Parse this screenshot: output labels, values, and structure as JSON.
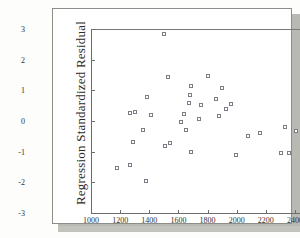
{
  "figure": {
    "ylabel": "Regression Standardized Residual"
  },
  "chart_data": {
    "type": "scatter",
    "title": "",
    "xlabel": "",
    "ylabel": "Regression Standardized Residual",
    "xlim": [
      1000,
      2600
    ],
    "ylim": [
      -3,
      3
    ],
    "xticks": [
      1000,
      1200,
      1400,
      1600,
      1800,
      2000,
      2200,
      2400,
      2600
    ],
    "yticks": [
      3,
      2,
      1,
      0,
      -1,
      -2,
      -3
    ],
    "grid": false,
    "legend": null,
    "marker": "open-square",
    "points": [
      {
        "x": 1500,
        "y": 2.85
      },
      {
        "x": 1530,
        "y": 1.43
      },
      {
        "x": 1800,
        "y": 1.48
      },
      {
        "x": 1690,
        "y": 1.15
      },
      {
        "x": 1900,
        "y": 1.07
      },
      {
        "x": 1385,
        "y": 0.78
      },
      {
        "x": 1680,
        "y": 0.85
      },
      {
        "x": 1855,
        "y": 0.73
      },
      {
        "x": 1675,
        "y": 0.6
      },
      {
        "x": 1960,
        "y": 0.56
      },
      {
        "x": 1755,
        "y": 0.52
      },
      {
        "x": 1925,
        "y": 0.4
      },
      {
        "x": 1300,
        "y": 0.3
      },
      {
        "x": 1265,
        "y": 0.26
      },
      {
        "x": 1640,
        "y": 0.23
      },
      {
        "x": 1410,
        "y": 0.2
      },
      {
        "x": 1880,
        "y": 0.16
      },
      {
        "x": 1745,
        "y": 0.05
      },
      {
        "x": 1615,
        "y": -0.03
      },
      {
        "x": 2330,
        "y": -0.18
      },
      {
        "x": 1360,
        "y": -0.28
      },
      {
        "x": 1650,
        "y": -0.3
      },
      {
        "x": 2410,
        "y": -0.33
      },
      {
        "x": 2160,
        "y": -0.38
      },
      {
        "x": 2075,
        "y": -0.5
      },
      {
        "x": 1285,
        "y": -0.7
      },
      {
        "x": 1545,
        "y": -0.71
      },
      {
        "x": 1505,
        "y": -0.83
      },
      {
        "x": 1690,
        "y": -1.02
      },
      {
        "x": 2305,
        "y": -1.05
      },
      {
        "x": 2360,
        "y": -1.04
      },
      {
        "x": 1995,
        "y": -1.1
      },
      {
        "x": 1265,
        "y": -1.44
      },
      {
        "x": 1180,
        "y": -1.53
      },
      {
        "x": 1380,
        "y": -1.97
      }
    ]
  }
}
